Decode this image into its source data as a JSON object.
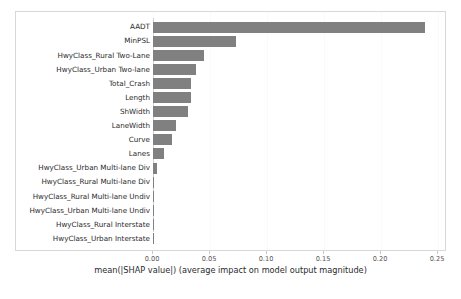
{
  "chart_data": {
    "type": "bar",
    "orientation": "horizontal",
    "title": "",
    "subtitle": "",
    "xlabel": "mean(|SHAP value|) (average impact on model output magnitude)",
    "ylabel": "",
    "xlim": [
      0.0,
      0.2625
    ],
    "xticks": [
      0.0,
      0.05,
      0.1,
      0.15,
      0.2,
      0.25
    ],
    "xticklabels": [
      "0.00",
      "0.05",
      "0.10",
      "0.15",
      "0.20",
      "0.25"
    ],
    "grid": "vertical-faint",
    "legend": null,
    "bar_color": "#808080",
    "categories": [
      "AADT",
      "MinPSL",
      "HwyClass_Rural Two-Lane",
      "HwyClass_Urban Two-lane",
      "Total_Crash",
      "Length",
      "ShWidth",
      "LaneWidth",
      "Curve",
      "Lanes",
      "HwyClass_Urban Multi-lane Div",
      "HwyClass_Rural Multi-lane Div",
      "HwyClass_Rural Multi-lane Undiv",
      "HwyClass_Urban Multi-lane Undiv",
      "HwyClass_Rural Interstate",
      "HwyClass_Urban Interstate"
    ],
    "values": [
      0.2385,
      0.0728,
      0.0447,
      0.0377,
      0.0333,
      0.0333,
      0.0307,
      0.0202,
      0.0167,
      0.0096,
      0.0035,
      0.0009,
      0.0004,
      0.0003,
      0.0002,
      0.0001
    ]
  },
  "figure": {
    "background_color": "#ffffff",
    "frame_color": "#d8d8d8"
  }
}
